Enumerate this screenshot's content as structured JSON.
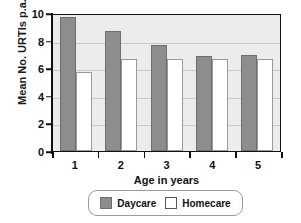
{
  "chart_data": {
    "type": "bar",
    "title": "",
    "xlabel": "Age in years",
    "ylabel": "Mean No. URTIs p.a.",
    "categories": [
      "1",
      "2",
      "3",
      "4",
      "5"
    ],
    "series": [
      {
        "name": "Daycare",
        "color": "#8d8d8d",
        "values": [
          9.7,
          8.7,
          7.7,
          6.9,
          6.95
        ]
      },
      {
        "name": "Homecare",
        "color": "#ffffff",
        "values": [
          5.7,
          6.65,
          6.7,
          6.7,
          6.7
        ]
      }
    ],
    "ylim": [
      0,
      10
    ],
    "yticks": [
      "0",
      "2",
      "4",
      "6",
      "8",
      "10"
    ],
    "grid": true,
    "legend_position": "bottom-center"
  },
  "legend": {
    "items": [
      {
        "label": "Daycare",
        "swatch": "filled-gray-square"
      },
      {
        "label": "Homecare",
        "swatch": "open-white-square"
      }
    ]
  }
}
